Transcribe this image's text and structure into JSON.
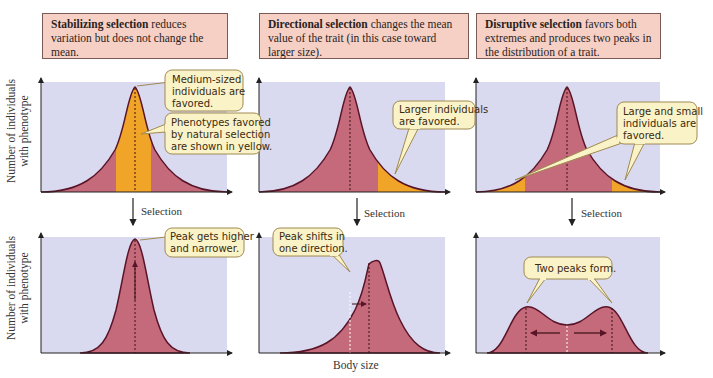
{
  "panels": [
    {
      "id": "stabilizing",
      "title_bold": "Stabilizing selection",
      "title_rest": " reduces variation but does not change the mean.",
      "top_callouts": [
        "Medium-sized individuals are favored.",
        "Phenotypes favored by natural selection are shown in yellow."
      ],
      "selection_label": "Selection",
      "bottom_callouts": [
        "Peak gets higher and narrower."
      ]
    },
    {
      "id": "directional",
      "title_bold": "Directional selection",
      "title_rest": " changes the mean value of the trait (in this case toward larger size).",
      "top_callouts": [
        "Larger individuals are favored."
      ],
      "selection_label": "Selection",
      "bottom_callouts": [
        "Peak shifts in one direction."
      ]
    },
    {
      "id": "disruptive",
      "title_bold": "Disruptive selection",
      "title_rest": " favors both extremes and produces two peaks in the distribution of a trait.",
      "top_callouts": [
        "Large and small individuals are favored."
      ],
      "selection_label": "Selection",
      "bottom_callouts": [
        "Two peaks form."
      ]
    }
  ],
  "axes": {
    "ylabel_top": "Number of individuals with phenotype",
    "ylabel_bottom": "Number of individuals with phenotype",
    "xlabel": "Body size"
  },
  "colors": {
    "plot_background": "#d9d9f0",
    "curve_fill": "#c46a7a",
    "curve_stroke": "#5a1428",
    "favored_fill": "#f0a428",
    "callout_fill": "#fbf3c8",
    "callout_stroke": "#a08a50",
    "title_fill": "#f6d0c4"
  }
}
